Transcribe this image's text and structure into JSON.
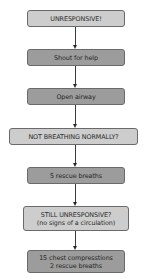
{
  "diagram": {
    "type": "flowchart",
    "direction": "top-to-bottom",
    "colors": {
      "decision_fill": "#cdcdcd",
      "action_fill": "#9c9c9c",
      "border": "#6a6a6a",
      "arrow": "#2a2a2a"
    },
    "nodes": [
      {
        "id": "n1",
        "kind": "decision",
        "lines": [
          "UNRESPONSIVE!"
        ]
      },
      {
        "id": "n2",
        "kind": "action",
        "lines": [
          "Shout for help"
        ]
      },
      {
        "id": "n3",
        "kind": "action",
        "lines": [
          "Open airway"
        ]
      },
      {
        "id": "n4",
        "kind": "decision",
        "lines": [
          "NOT BREATHING NORMALLY?"
        ]
      },
      {
        "id": "n5",
        "kind": "action",
        "lines": [
          "5 rescue breaths"
        ]
      },
      {
        "id": "n6",
        "kind": "decision",
        "lines": [
          "STILL UNRESPONSIVE?",
          "(no signs of a circulation)"
        ]
      },
      {
        "id": "n7",
        "kind": "action",
        "lines": [
          "15 chest compresstions",
          "2 rescue breaths"
        ]
      }
    ],
    "edges": [
      {
        "from": "n1",
        "to": "n2"
      },
      {
        "from": "n2",
        "to": "n3"
      },
      {
        "from": "n3",
        "to": "n4"
      },
      {
        "from": "n4",
        "to": "n5"
      },
      {
        "from": "n5",
        "to": "n6"
      },
      {
        "from": "n6",
        "to": "n7"
      }
    ]
  }
}
